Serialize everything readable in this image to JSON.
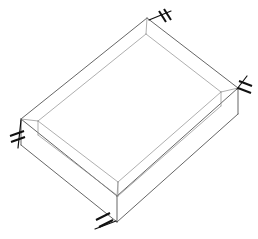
{
  "drawing": {
    "title": "Rectangular Frame Assembly",
    "projection": "isometric",
    "line_color": "#4a4a4a",
    "light_line_color": "#8c8c8c",
    "mark_color": "#111111",
    "background": "#ffffff",
    "canvas": {
      "width": 258,
      "height": 239
    }
  },
  "geometry": {
    "description": "Hollow rectangular frame shown in isometric view, four mitred rails with visible thickness",
    "top_outer_corners": {
      "top": [
        147,
        18
      ],
      "right": [
        238,
        88
      ],
      "bottom": [
        117,
        196
      ],
      "left": [
        21,
        119
      ]
    },
    "top_inner_corners": {
      "top": [
        146,
        34
      ],
      "right": [
        221,
        92
      ],
      "bottom": [
        118,
        182
      ],
      "left": [
        38,
        121
      ]
    },
    "rail_depth_px": 26,
    "visible_side_faces": [
      "front-left",
      "front-right"
    ]
  },
  "annotations": {
    "symbol_name": "weld-hatch-mark",
    "count": 4,
    "items": [
      {
        "id": "mark-top",
        "corner": "top",
        "x": 164,
        "y": 18
      },
      {
        "id": "mark-right",
        "corner": "right",
        "x": 246,
        "y": 82
      },
      {
        "id": "mark-left",
        "corner": "left",
        "x": 14,
        "y": 133
      },
      {
        "id": "mark-bottom",
        "corner": "bottom",
        "x": 102,
        "y": 219
      }
    ]
  }
}
